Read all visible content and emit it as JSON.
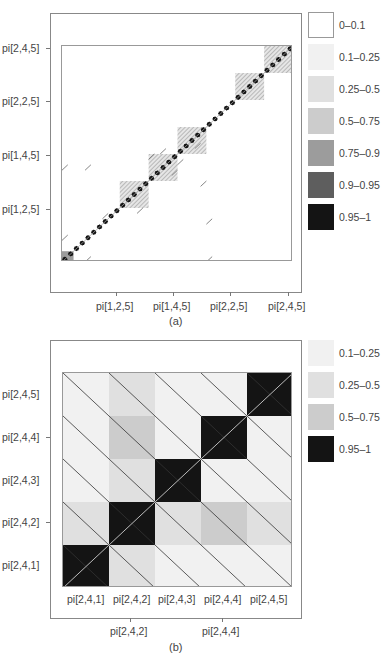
{
  "legend_a": {
    "items": [
      {
        "label": "0–0.1",
        "color": "#ffffff",
        "border": "#999999"
      },
      {
        "label": "0.1–0.25",
        "color": "#f1f1f1"
      },
      {
        "label": "0.25–0.5",
        "color": "#e0e0e0"
      },
      {
        "label": "0.5–0.75",
        "color": "#cccccc"
      },
      {
        "label": "0.75–0.9",
        "color": "#9c9c9c"
      },
      {
        "label": "0.9–0.95",
        "color": "#5e5e5e"
      },
      {
        "label": "0.95–1",
        "color": "#141414"
      }
    ]
  },
  "legend_b": {
    "items": [
      {
        "label": "0.1–0.25",
        "color": "#f1f1f1"
      },
      {
        "label": "0.25–0.5",
        "color": "#e0e0e0"
      },
      {
        "label": "0.5–0.75",
        "color": "#cccccc"
      },
      {
        "label": "0.95–1",
        "color": "#141414"
      }
    ]
  },
  "panel_a": {
    "caption": "(a)",
    "y_ticks": [
      "pi[2,4,5]",
      "pi[2,2,5]",
      "pi[1,4,5]",
      "pi[1,2,5]"
    ],
    "x_ticks": [
      "pi[1,2,5]",
      "pi[1,4,5]",
      "pi[2,2,5]",
      "pi[2,4,5]"
    ]
  },
  "panel_b": {
    "caption": "(b)",
    "y_labels": [
      "pi[2,4,5]",
      "pi[2,4,4]",
      "pi[2,4,3]",
      "pi[2,4,2]",
      "pi[2,4,1]"
    ],
    "x_labels": [
      "pi[2,4,1]",
      "pi[2,4,2]",
      "pi[2,4,3]",
      "pi[2,4,4]",
      "pi[2,4,5]"
    ],
    "x_ticks": [
      "pi[2,4,2]",
      "pi[2,4,4]"
    ]
  },
  "chart_data": [
    {
      "type": "heatmap",
      "title": "(a)",
      "description": "Posterior probability image plot over 40 parameters pi[i,j,k]; near-diagonal blocks of high probability",
      "xlabel": "",
      "ylabel": "",
      "x_tick_labels": [
        "pi[1,2,5]",
        "pi[1,4,5]",
        "pi[2,2,5]",
        "pi[2,4,5]"
      ],
      "y_tick_labels": [
        "pi[1,2,5]",
        "pi[1,4,5]",
        "pi[2,2,5]",
        "pi[2,4,5]"
      ],
      "legend": [
        "0-0.1",
        "0.1-0.25",
        "0.25-0.5",
        "0.5-0.75",
        "0.75-0.9",
        "0.9-0.95",
        "0.95-1"
      ],
      "n": 40,
      "diagonal_value": "0.95-1",
      "blocks": [
        {
          "from": 1,
          "to": 2,
          "level": "0.75-0.9"
        },
        {
          "from": 11,
          "to": 15,
          "level": "0.25-0.5"
        },
        {
          "from": 16,
          "to": 20,
          "level": "0.25-0.5"
        },
        {
          "from": 21,
          "to": 25,
          "level": "0.25-0.5"
        },
        {
          "from": 31,
          "to": 35,
          "level": "0.25-0.5"
        },
        {
          "from": 36,
          "to": 40,
          "level": "0.25-0.5"
        }
      ],
      "legend_position": "right"
    },
    {
      "type": "heatmap",
      "title": "(b)",
      "x": [
        "pi[2,4,1]",
        "pi[2,4,2]",
        "pi[2,4,3]",
        "pi[2,4,4]",
        "pi[2,4,5]"
      ],
      "y": [
        "pi[2,4,1]",
        "pi[2,4,2]",
        "pi[2,4,3]",
        "pi[2,4,4]",
        "pi[2,4,5]"
      ],
      "legend": [
        "0.1-0.25",
        "0.25-0.5",
        "0.5-0.75",
        "0.95-1"
      ],
      "cells_top_to_bottom": [
        [
          "0.1-0.25",
          "0.25-0.5",
          "0.1-0.25",
          "0.1-0.25",
          "0.95-1"
        ],
        [
          "0.1-0.25",
          "0.5-0.75",
          "0.1-0.25",
          "0.95-1",
          "0.1-0.25"
        ],
        [
          "0.1-0.25",
          "0.25-0.5",
          "0.95-1",
          "0.1-0.25",
          "0.1-0.25"
        ],
        [
          "0.25-0.5",
          "0.95-1",
          "0.25-0.5",
          "0.5-0.75",
          "0.25-0.5"
        ],
        [
          "0.95-1",
          "0.25-0.5",
          "0.1-0.25",
          "0.1-0.25",
          "0.1-0.25"
        ]
      ],
      "legend_position": "right"
    }
  ]
}
